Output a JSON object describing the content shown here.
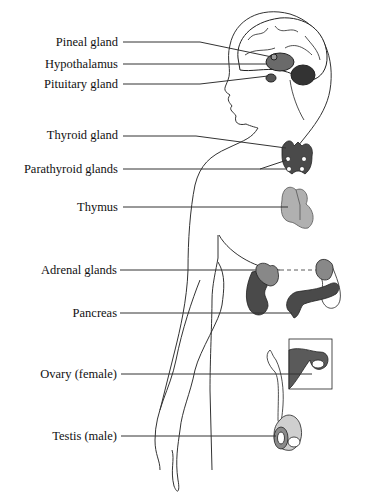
{
  "diagram": {
    "type": "anatomical-labeled-diagram",
    "labels": [
      {
        "id": "pineal",
        "text": "Pineal gland",
        "y": 42
      },
      {
        "id": "hypothalamus",
        "text": "Hypothalamus",
        "y": 64
      },
      {
        "id": "pituitary",
        "text": "Pituitary gland",
        "y": 84
      },
      {
        "id": "thyroid",
        "text": "Thyroid gland",
        "y": 135
      },
      {
        "id": "parathyroid",
        "text": "Parathyroid glands",
        "y": 169
      },
      {
        "id": "thymus",
        "text": "Thymus",
        "y": 207
      },
      {
        "id": "adrenal",
        "text": "Adrenal glands",
        "y": 270
      },
      {
        "id": "pancreas",
        "text": "Pancreas",
        "y": 313
      },
      {
        "id": "ovary",
        "text": "Ovary (female)",
        "y": 373
      },
      {
        "id": "testis",
        "text": "Testis (male)",
        "y": 436
      }
    ],
    "colors": {
      "dark_organ": "#4a4a4a",
      "mid_organ": "#7a7a7a",
      "light_organ": "#b0b0b0",
      "outline": "#222222",
      "leader_line": "#333333"
    }
  }
}
